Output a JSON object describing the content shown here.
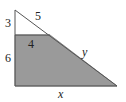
{
  "diagram": {
    "type": "right-triangle-with-shaded-trapezoid",
    "colors": {
      "fill": "#9a9a9a",
      "stroke": "#555555",
      "background": "#ffffff"
    },
    "labels": {
      "left_top_segment": "3",
      "hypotenuse_top_segment": "5",
      "cut_line": "4",
      "left_bottom_segment": "6",
      "hypotenuse_bottom_segment": "y",
      "base": "x"
    }
  }
}
